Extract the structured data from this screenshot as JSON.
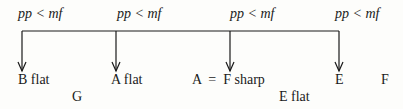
{
  "dynamics": [
    {
      "text": "pp < mf",
      "x": 18
    },
    {
      "text": "pp < mf",
      "x": 117
    },
    {
      "text": "pp < mf",
      "x": 230
    },
    {
      "text": "pp < mf",
      "x": 335
    }
  ],
  "labels_upper": [
    {
      "text": "B flat",
      "x": 18
    },
    {
      "text": "A flat",
      "x": 111
    },
    {
      "text": "A  =  F sharp",
      "x": 192
    },
    {
      "text": "E",
      "x": 335
    },
    {
      "text": "F",
      "x": 381
    }
  ],
  "labels_lower": [
    {
      "text": "G",
      "x": 72
    },
    {
      "text": "E flat",
      "x": 279
    }
  ],
  "line_color": "#1a1a1a"
}
